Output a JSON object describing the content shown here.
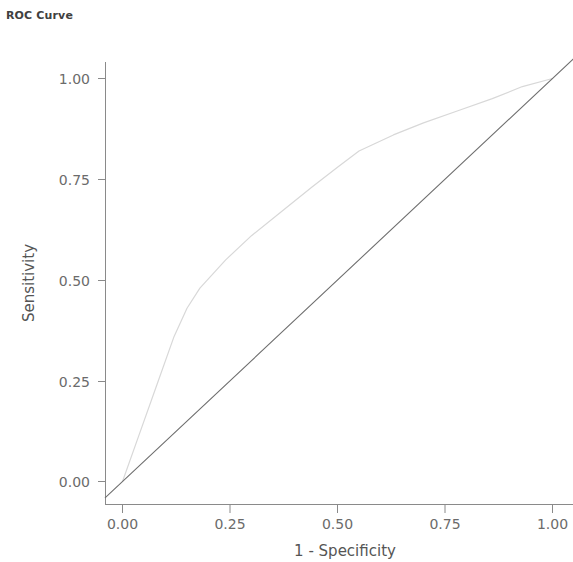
{
  "chart_data": {
    "type": "line",
    "title": "ROC Curve",
    "xlabel": "1 - Specificity",
    "ylabel": "Sensitivity",
    "xlim": [
      0,
      1
    ],
    "ylim": [
      0,
      1
    ],
    "grid": false,
    "legend": "none",
    "xticks": [
      "0.00",
      "0.25",
      "0.50",
      "0.75",
      "1.00"
    ],
    "xtick_values": [
      0,
      0.25,
      0.5,
      0.75,
      1
    ],
    "ytticks_note": "",
    "yticks": [
      "0.00",
      "0.25",
      "0.50",
      "0.75",
      "1.00"
    ],
    "ytick_values": [
      0,
      0.25,
      0.5,
      0.75,
      1
    ],
    "series": [
      {
        "name": "ROC curve",
        "color": "#d8d8d8",
        "x": [
          0.0,
          0.04,
          0.08,
          0.12,
          0.15,
          0.18,
          0.24,
          0.3,
          0.37,
          0.44,
          0.5,
          0.55,
          0.59,
          0.63,
          0.7,
          0.78,
          0.86,
          0.93,
          1.0
        ],
        "y": [
          0.0,
          0.12,
          0.24,
          0.36,
          0.43,
          0.48,
          0.55,
          0.61,
          0.67,
          0.73,
          0.78,
          0.82,
          0.84,
          0.86,
          0.89,
          0.92,
          0.95,
          0.98,
          1.0
        ]
      },
      {
        "name": "Reference diagonal",
        "color": "#6f6f6f",
        "x": [
          -0.04,
          1.05
        ],
        "y": [
          -0.04,
          1.05
        ]
      }
    ]
  },
  "axes": {
    "x_title": "1 - Specificity",
    "y_title": "Sensitivity",
    "x_tick_labels": [
      "0.00",
      "0.25",
      "0.50",
      "0.75",
      "1.00"
    ],
    "y_tick_labels": [
      "0.00",
      "0.25",
      "0.50",
      "0.75",
      "1.00"
    ]
  },
  "title": "ROC Curve",
  "colors": {
    "title": "#404040",
    "axis": "#8a8a8a",
    "tick_label": "#6b6b6b",
    "roc_line": "#d8d8d8",
    "reference_line": "#6f6f6f",
    "background": "#ffffff"
  }
}
